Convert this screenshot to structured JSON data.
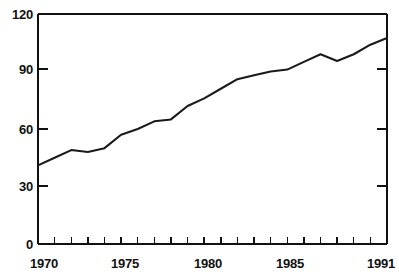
{
  "chart_data": {
    "type": "line",
    "title": "",
    "subtitle": "",
    "xlabel": "",
    "ylabel": "",
    "xlim": [
      1970,
      1991
    ],
    "ylim": [
      0,
      120
    ],
    "grid": false,
    "legend": null,
    "annotations": [],
    "y_ticks": [
      0,
      30,
      60,
      90,
      120
    ],
    "y_tick_labels": [
      "0",
      "30",
      "60",
      "90",
      "120"
    ],
    "x_ticks": [
      1970,
      1971,
      1972,
      1973,
      1974,
      1975,
      1976,
      1977,
      1978,
      1979,
      1980,
      1981,
      1982,
      1983,
      1984,
      1985,
      1986,
      1987,
      1988,
      1989,
      1990,
      1991
    ],
    "x_tick_labels_shown": [
      "1970",
      "1975",
      "1980",
      "1985",
      "1991"
    ],
    "x_labeled_ticks": [
      1970,
      1975,
      1980,
      1985,
      1991
    ],
    "series": [
      {
        "name": "series-1",
        "color": "#1a1a1a",
        "x": [
          1970,
          1971,
          1972,
          1973,
          1974,
          1975,
          1976,
          1977,
          1978,
          1979,
          1980,
          1981,
          1982,
          1983,
          1984,
          1985,
          1986,
          1987,
          1988,
          1989,
          1990,
          1991
        ],
        "values": [
          41,
          45,
          49,
          48,
          50,
          57,
          60,
          64,
          65,
          72,
          76,
          81,
          86,
          88,
          90,
          91,
          95,
          99,
          95.5,
          99,
          104,
          107.5
        ]
      }
    ]
  },
  "axes": {
    "y_labels": [
      {
        "value": 120,
        "text": "120"
      },
      {
        "value": 90,
        "text": "90"
      },
      {
        "value": 60,
        "text": "60"
      },
      {
        "value": 30,
        "text": "30"
      },
      {
        "value": 0,
        "text": "0"
      }
    ],
    "x_labels": [
      {
        "value": 1970,
        "text": "1970"
      },
      {
        "value": 1975,
        "text": "1975"
      },
      {
        "value": 1980,
        "text": "1980"
      },
      {
        "value": 1985,
        "text": "1985"
      },
      {
        "value": 1991,
        "text": "1991"
      }
    ]
  },
  "colors": {
    "line": "#1a1a1a",
    "axis": "#111111",
    "background": "#ffffff",
    "text": "#111111"
  }
}
